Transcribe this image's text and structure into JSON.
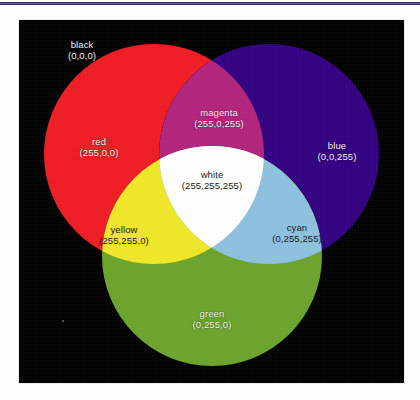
{
  "page": {
    "background_color": "#fdfdfd",
    "top_rule_color": "#3b2e6e"
  },
  "figure": {
    "panel_background": "#000000",
    "panel_label": "additive-color-venn-diagram"
  },
  "chart_data": {
    "type": "venn",
    "title": "",
    "background": {
      "name": "black",
      "rgb": "(0,0,0)",
      "hex": "#000000",
      "text_color": "#f2f2f2"
    },
    "circles": [
      {
        "name": "red",
        "rgb": "(255,0,0)",
        "hex": "#ee1b22",
        "cx": 135,
        "cy": 134,
        "r": 110,
        "label_x": 80,
        "label_y": 127,
        "text_color": "#f2f2f2"
      },
      {
        "name": "blue",
        "rgb": "(0,0,255)",
        "hex": "#310080",
        "cx": 250,
        "cy": 134,
        "r": 110,
        "label_x": 318,
        "label_y": 131,
        "text_color": "#f2f2f2"
      },
      {
        "name": "green",
        "rgb": "(0,255,0)",
        "hex": "#6aa22a",
        "cx": 193,
        "cy": 236,
        "r": 110,
        "label_x": 193,
        "label_y": 299,
        "text_color": "#f2f2f2"
      }
    ],
    "intersections": [
      {
        "name": "magenta",
        "rgb": "(255,0,255)",
        "hex": "#b0237a",
        "of": [
          "red",
          "blue"
        ],
        "label_x": 200,
        "label_y": 98,
        "text_color": "#f2f2f2"
      },
      {
        "name": "yellow",
        "rgb": "(255,255,0)",
        "hex": "#eee626",
        "of": [
          "red",
          "green"
        ],
        "label_x": 105,
        "label_y": 215,
        "text_color": "#1a1a1a"
      },
      {
        "name": "cyan",
        "rgb": "(0,255,255)",
        "hex": "#8cc0df",
        "of": [
          "blue",
          "green"
        ],
        "label_x": 278,
        "label_y": 213,
        "text_color": "#1a1a1a"
      },
      {
        "name": "white",
        "rgb": "(255,255,255)",
        "hex": "#fdfdfb",
        "of": [
          "red",
          "green",
          "blue"
        ],
        "label_x": 193,
        "label_y": 160,
        "text_color": "#1a1a1a"
      }
    ]
  }
}
